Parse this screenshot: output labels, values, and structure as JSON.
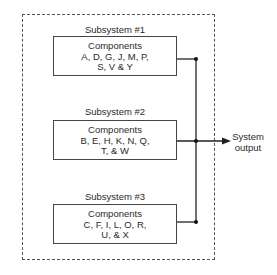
{
  "diagram": {
    "type": "parallel-subsystems",
    "subsystems": [
      {
        "label": "Subsystem #1",
        "title": "Components",
        "line1": "A, D, G, J, M, P,",
        "line2": "S, V & Y"
      },
      {
        "label": "Subsystem #2",
        "title": "Components",
        "line1": "B, E, H, K, N, Q,",
        "line2": "T, & W"
      },
      {
        "label": "Subsystem #3",
        "title": "Components",
        "line1": "C, F, I, L, O, R,",
        "line2": "U, & X"
      }
    ],
    "output": {
      "line1": "System",
      "line2": "output"
    },
    "colors": {
      "line": "#222222",
      "border": "#444444",
      "dashed": "#555555"
    }
  }
}
